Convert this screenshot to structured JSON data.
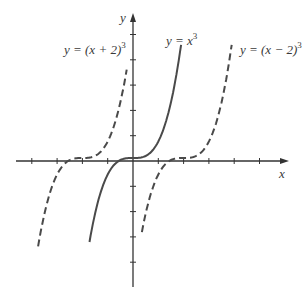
{
  "figure": {
    "axes": {
      "x_label": "x",
      "y_label": "y",
      "origin_px": [
        133,
        161
      ],
      "unit_px": 25.3,
      "x_ticks": [
        -4,
        -3,
        -2,
        -1,
        1,
        2,
        3,
        4,
        5
      ],
      "y_ticks": [
        -4,
        -3,
        -2,
        -1,
        1,
        2,
        3,
        4,
        5
      ]
    },
    "curves": [
      {
        "name": "left-shift",
        "label_prefix": "y = (x + 2)",
        "label_sup": "3",
        "style": "dashed",
        "shift": -2,
        "x_range": [
          -3.75,
          -0.25
        ]
      },
      {
        "name": "cube",
        "label_prefix": "y = x",
        "label_sup": "3",
        "style": "solid",
        "shift": 0,
        "x_range": [
          -1.72,
          1.9
        ]
      },
      {
        "name": "right-shift",
        "label_prefix": "y = (x − 2)",
        "label_sup": "3",
        "style": "dashed",
        "shift": 2,
        "x_range": [
          0.35,
          3.9
        ]
      }
    ],
    "stroke_color": "#4a4a4a"
  },
  "chart_data": {
    "type": "line",
    "title": "",
    "xlabel": "x",
    "ylabel": "y",
    "legend": [
      "y = (x + 2)^3",
      "y = x^3",
      "y = (x − 2)^3"
    ],
    "series": [
      {
        "name": "y = (x + 2)^3",
        "style": "dashed",
        "x": [
          -3.7,
          -3,
          -2.5,
          -2,
          -1.5,
          -1,
          -0.3
        ],
        "y": [
          -4.9,
          -1,
          -0.125,
          0,
          0.125,
          1,
          4.9
        ]
      },
      {
        "name": "y = x^3",
        "style": "solid",
        "x": [
          -1.7,
          -1,
          -0.5,
          0,
          0.5,
          1,
          1.9
        ],
        "y": [
          -4.9,
          -1,
          -0.125,
          0,
          0.125,
          1,
          6.9
        ]
      },
      {
        "name": "y = (x − 2)^3",
        "style": "dashed",
        "x": [
          0.4,
          1,
          1.5,
          2,
          2.5,
          3,
          3.9
        ],
        "y": [
          -4.1,
          -1,
          -0.125,
          0,
          0.125,
          1,
          6.9
        ]
      }
    ],
    "grid": false
  }
}
